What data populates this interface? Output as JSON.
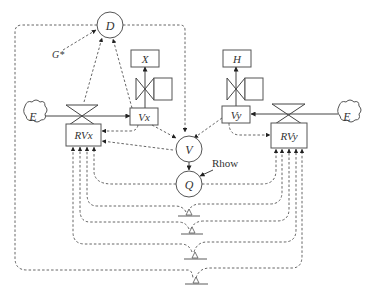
{
  "diagram": {
    "nodes": {
      "D": "D",
      "G": "G*",
      "X": "X",
      "H": "H",
      "Vx": "Vx",
      "Vy": "Vy",
      "RVx": "RVx",
      "RVy": "RVy",
      "E_left": "E",
      "E_right": "E",
      "V": "V",
      "Q": "Q",
      "Rhow": "Rhow"
    },
    "edges": [
      {
        "from": "E_left",
        "to": "Vx",
        "style": "solid"
      },
      {
        "from": "E_right",
        "to": "Vy",
        "style": "solid"
      },
      {
        "from": "Vx",
        "to": "X",
        "style": "solid"
      },
      {
        "from": "Vy",
        "to": "H",
        "style": "solid"
      },
      {
        "from": "G*",
        "to": "D",
        "style": "dashed"
      },
      {
        "from": "RVx",
        "to": "D",
        "style": "dashed"
      },
      {
        "from": "Vx",
        "to": "D",
        "style": "dashed"
      },
      {
        "from": "D",
        "to": "V",
        "style": "dashed"
      },
      {
        "from": "Vx",
        "to": "V",
        "style": "dashed"
      },
      {
        "from": "Vy",
        "to": "V",
        "style": "dashed"
      },
      {
        "from": "Vx",
        "to": "RVx",
        "style": "dashed"
      },
      {
        "from": "V",
        "to": "RVx",
        "style": "dashed"
      },
      {
        "from": "Vy",
        "to": "RVy",
        "style": "dashed"
      },
      {
        "from": "V",
        "to": "Q",
        "style": "solid"
      },
      {
        "from": "Rhow",
        "to": "Q",
        "style": "solid"
      },
      {
        "from": "Q",
        "to": "RVx",
        "style": "dashed"
      },
      {
        "from": "Q",
        "to": "RVy",
        "style": "dashed"
      },
      {
        "from": "ground_1",
        "to": "RVx",
        "style": "dashed"
      },
      {
        "from": "ground_1",
        "to": "RVy",
        "style": "dashed"
      },
      {
        "from": "ground_2",
        "to": "RVx",
        "style": "dashed"
      },
      {
        "from": "ground_2",
        "to": "RVy",
        "style": "dashed"
      },
      {
        "from": "ground_3",
        "to": "RVx",
        "style": "dashed"
      },
      {
        "from": "ground_3",
        "to": "RVy",
        "style": "dashed"
      },
      {
        "from": "ground_4",
        "to": "D",
        "style": "dashed"
      },
      {
        "from": "ground_4",
        "to": "RVy",
        "style": "dashed"
      }
    ]
  }
}
